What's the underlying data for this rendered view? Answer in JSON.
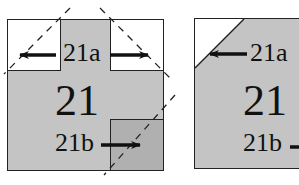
{
  "diagram": {
    "left_panel": {
      "main_label": "21",
      "top_label": "21a",
      "bottom_label": "21b"
    },
    "right_panel": {
      "main_label": "21",
      "top_label": "21a",
      "bottom_label": "21b"
    },
    "colors": {
      "fill_gray": "#c4c4c4",
      "fill_dark_gray": "#b0b0b0",
      "fill_white": "#ffffff",
      "stroke": "#222222"
    }
  }
}
